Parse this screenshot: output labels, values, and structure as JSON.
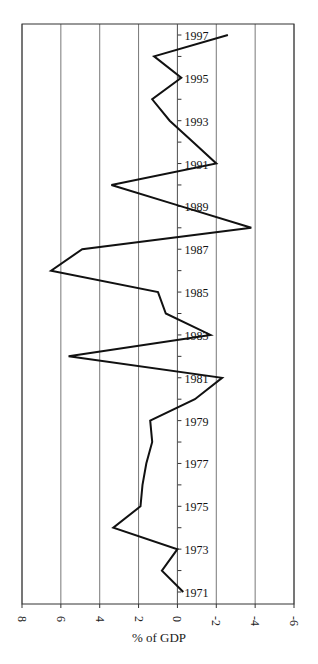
{
  "chart_data": {
    "type": "line",
    "orientation": "rotated-horizontal",
    "title": "",
    "xlabel": "% of GDP",
    "ylabel": "",
    "x_axis": {
      "ticks": [
        8,
        6,
        4,
        2,
        0,
        -2,
        -4,
        -6
      ],
      "tick_labels": [
        "8",
        "6",
        "4",
        "2",
        "0",
        "-2",
        "-4",
        "-6"
      ],
      "range": [
        8,
        -6
      ],
      "reversed": true,
      "grid": true
    },
    "y_axis": {
      "range": [
        1971,
        1997
      ],
      "tick_labels": [
        "1971",
        "1973",
        "1975",
        "1977",
        "1979",
        "1981",
        "1983",
        "1985",
        "1987",
        "1989",
        "1991",
        "1993",
        "1995",
        "1997"
      ],
      "labels_position": "along zero line"
    },
    "series": [
      {
        "name": "% of GDP",
        "years": [
          1971,
          1972,
          1973,
          1974,
          1975,
          1976,
          1977,
          1978,
          1979,
          1980,
          1981,
          1982,
          1983,
          1984,
          1985,
          1986,
          1987,
          1988,
          1989,
          1990,
          1991,
          1992,
          1993,
          1994,
          1995,
          1996,
          1997
        ],
        "values": [
          -0.3,
          0.8,
          0.0,
          3.3,
          1.9,
          1.8,
          1.6,
          1.3,
          1.4,
          -0.9,
          -2.3,
          5.6,
          -1.7,
          0.6,
          1.0,
          6.5,
          4.9,
          -3.8,
          -0.2,
          3.4,
          -2.0,
          -0.8,
          0.4,
          1.3,
          -0.2,
          1.2,
          -2.6
        ]
      }
    ],
    "legend": null
  }
}
